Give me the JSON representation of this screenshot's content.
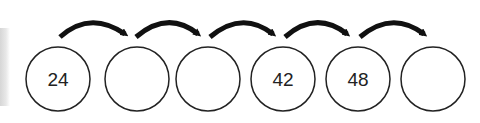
{
  "diagram": {
    "type": "number-sequence-jumps",
    "circles": [
      {
        "value": "24",
        "cx": 58
      },
      {
        "value": "",
        "cx": 137
      },
      {
        "value": "",
        "cx": 208
      },
      {
        "value": "42",
        "cx": 283
      },
      {
        "value": "48",
        "cx": 358
      },
      {
        "value": "",
        "cx": 433
      }
    ],
    "arrow_count": 5,
    "colors": {
      "stroke": "#222222",
      "arrow": "#111111",
      "background": "#ffffff"
    }
  }
}
